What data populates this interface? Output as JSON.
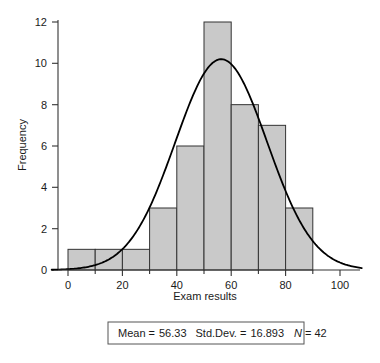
{
  "chart_data": {
    "type": "bar",
    "title": "",
    "subtitle": "",
    "xlabel": "Exam results",
    "ylabel": "Frequency",
    "xlim": [
      -6,
      108
    ],
    "ylim": [
      0,
      12.8
    ],
    "grid": false,
    "legend": null,
    "bin_width": 10,
    "categories": [
      "0-10",
      "10-20",
      "20-30",
      "30-40",
      "40-50",
      "50-60",
      "60-70",
      "70-80",
      "80-90"
    ],
    "bin_edges": [
      0,
      10,
      20,
      30,
      40,
      50,
      60,
      70,
      80,
      90
    ],
    "values": [
      1,
      1,
      1,
      3,
      6,
      12,
      8,
      7,
      3
    ],
    "x_ticks_major": [
      0,
      20,
      40,
      60,
      80,
      100
    ],
    "x_tick_labels": [
      "0",
      "20",
      "40",
      "60",
      "80",
      "100"
    ],
    "x_ticks_minor": [
      10,
      30,
      50,
      70,
      90
    ],
    "y_ticks": [
      0,
      2,
      4,
      6,
      8,
      10,
      12
    ],
    "y_tick_labels": [
      "0",
      "2",
      "4",
      "6",
      "8",
      "10",
      "12"
    ],
    "overlay": {
      "type": "normal-curve",
      "mean": 56.33,
      "std_dev": 16.893,
      "n": 42,
      "peak_value": 10.2
    },
    "bar_fill_color": "#c9c9c9",
    "bar_edge_color": "#333333",
    "curve_color": "#000000",
    "axis_color": "#333333"
  },
  "stats_box": {
    "mean_label": "Mean =",
    "mean_value": "56.33",
    "stddev_label": "Std.Dev. =",
    "stddev_value": "16.893",
    "n_label": "N",
    "n_equals": "=",
    "n_value": "42"
  },
  "axes": {
    "y_title": "Frequency",
    "x_title": "Exam results"
  }
}
